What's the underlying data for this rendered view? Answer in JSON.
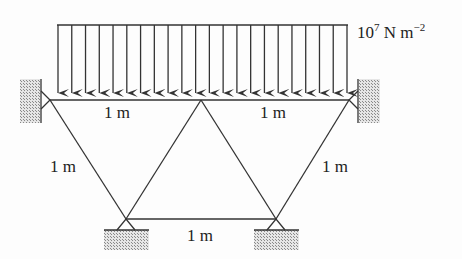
{
  "diagram": {
    "type": "pin-jointed truss under distributed load",
    "load": {
      "magnitude_base": "10",
      "magnitude_exp": "7",
      "unit_main": " N m",
      "unit_exp": "−2",
      "arrow_count": 22,
      "color": "#333333"
    },
    "members": {
      "top_left": "1 m",
      "top_right": "1 m",
      "diag_left": "1 m",
      "diag_right": "1 m",
      "bottom": "1 m"
    },
    "supports": [
      "left-wall-pin",
      "right-wall-pin",
      "bottom-left-pin",
      "bottom-right-pin"
    ],
    "colors": {
      "line": "#333333",
      "hatch": "#9a9a9a"
    }
  }
}
